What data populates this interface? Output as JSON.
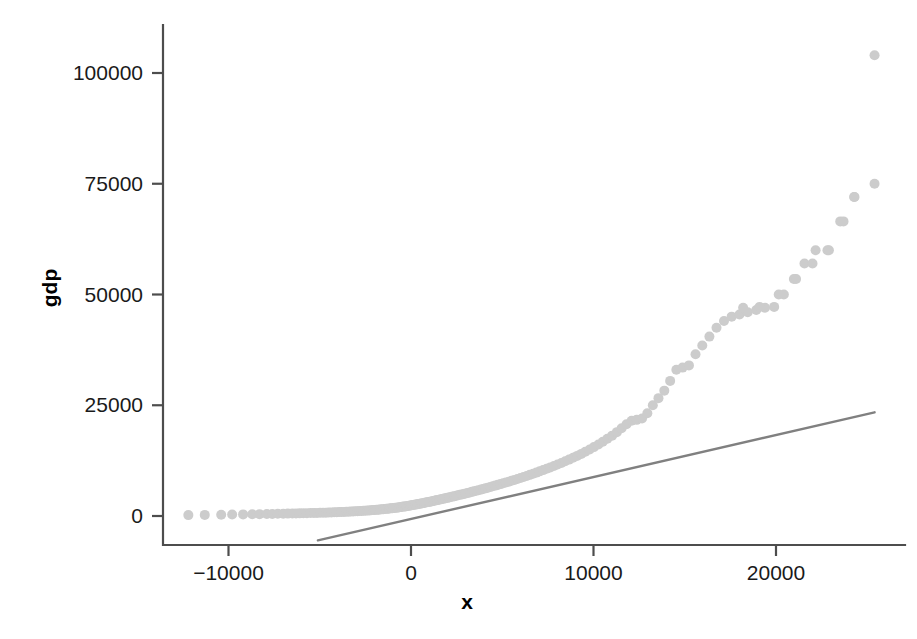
{
  "chart_data": {
    "type": "scatter",
    "title": "",
    "subtitle": "",
    "xlabel": "x",
    "ylabel": "gdp",
    "grid": false,
    "legend": null,
    "xlim": [
      -13200,
      26000
    ],
    "ylim": [
      -7000,
      108000
    ],
    "xticks": [
      -10000,
      0,
      10000,
      20000
    ],
    "xticklabels": [
      "-10000",
      "0",
      "10000",
      "20000"
    ],
    "yticks": [
      0,
      25000,
      50000,
      75000,
      100000
    ],
    "yticklabels": [
      "0",
      "25000",
      "50000",
      "75000",
      "100000"
    ],
    "point_color": "#cccccc",
    "point_size": 5,
    "line_color": "#808080",
    "series": [
      {
        "name": "gdp",
        "kind": "scatter",
        "x": [
          -12200,
          -11300,
          -10400,
          -9800,
          -9200,
          -8700,
          -8300,
          -7900,
          -7600,
          -7300,
          -7000,
          -6750,
          -6500,
          -6300,
          -6100,
          -5900,
          -5700,
          -5500,
          -5320,
          -5150,
          -4980,
          -4820,
          -4660,
          -4510,
          -4360,
          -4210,
          -4070,
          -3930,
          -3800,
          -3670,
          -3540,
          -3410,
          -3290,
          -3170,
          -3050,
          -2930,
          -2820,
          -2710,
          -2600,
          -2490,
          -2380,
          -2280,
          -2180,
          -2080,
          -1980,
          -1880,
          -1790,
          -1700,
          -1610,
          -1520,
          -1430,
          -1340,
          -1260,
          -1180,
          -1100,
          -1020,
          -940,
          -860,
          -780,
          -700,
          -630,
          -550,
          -480,
          -400,
          -330,
          -250,
          -180,
          -100,
          -30,
          40,
          110,
          190,
          260,
          340,
          410,
          490,
          560,
          640,
          720,
          800,
          880,
          960,
          1040,
          1120,
          1200,
          1290,
          1370,
          1460,
          1540,
          1630,
          1720,
          1810,
          1900,
          1990,
          2090,
          2180,
          2280,
          2380,
          2480,
          2580,
          2680,
          2790,
          2890,
          3000,
          3110,
          3230,
          3340,
          3460,
          3580,
          3700,
          3830,
          3950,
          4080,
          4210,
          4350,
          4480,
          4620,
          4760,
          4910,
          5050,
          5200,
          5360,
          5510,
          5670,
          5830,
          6000,
          6170,
          6340,
          6510,
          6690,
          6870,
          7050,
          7240,
          7430,
          7630,
          7830,
          8030,
          8240,
          8450,
          8660,
          8880,
          9100,
          9330,
          9550,
          9790,
          10020,
          10270,
          10510,
          10760,
          11020,
          11280,
          11540,
          11810,
          12090,
          12370,
          12660,
          12950,
          13250,
          13560,
          13880,
          14200,
          14540,
          14880,
          15230,
          15590,
          15960,
          16350,
          16740,
          17150,
          17570,
          18000,
          18450,
          18920,
          19400,
          19900,
          20430,
          20980,
          21560,
          22170,
          22820,
          23520,
          24280,
          25400
        ],
        "y": [
          200,
          250,
          300,
          320,
          360,
          390,
          420,
          450,
          470,
          500,
          520,
          540,
          560,
          580,
          600,
          620,
          640,
          660,
          680,
          700,
          720,
          740,
          760,
          790,
          810,
          830,
          860,
          880,
          900,
          930,
          950,
          980,
          1000,
          1030,
          1060,
          1090,
          1110,
          1140,
          1170,
          1200,
          1230,
          1260,
          1290,
          1330,
          1360,
          1390,
          1430,
          1460,
          1500,
          1530,
          1570,
          1610,
          1650,
          1690,
          1730,
          1770,
          1810,
          1850,
          1890,
          1940,
          1980,
          2030,
          2070,
          2120,
          2170,
          2220,
          2270,
          2320,
          2370,
          2430,
          2480,
          2540,
          2590,
          2650,
          2710,
          2770,
          2830,
          2900,
          2960,
          3030,
          3090,
          3160,
          3230,
          3300,
          3380,
          3450,
          3530,
          3600,
          3680,
          3760,
          3850,
          3930,
          4020,
          4100,
          4190,
          4290,
          4380,
          4480,
          4570,
          4670,
          4780,
          4880,
          4990,
          5100,
          5210,
          5330,
          5450,
          5570,
          5700,
          5830,
          5960,
          6100,
          6240,
          6390,
          6540,
          6700,
          6860,
          7030,
          7200,
          7380,
          7560,
          7750,
          7950,
          8150,
          8360,
          8580,
          8810,
          9040,
          9290,
          9540,
          9800,
          10080,
          10360,
          10660,
          10970,
          11290,
          11630,
          11980,
          12350,
          12730,
          13140,
          13570,
          14020,
          14500,
          15010,
          15550,
          16130,
          16750,
          17420,
          18140,
          18930,
          19790,
          20730,
          21500,
          21700,
          22000,
          23200,
          25000,
          26600,
          28300,
          30500,
          33000,
          33500,
          34000,
          36500,
          38500,
          40500,
          42500,
          44000,
          45000,
          45500,
          46000,
          46500,
          47000,
          47200,
          50000,
          53500,
          57000,
          60000,
          60000,
          66500,
          72000,
          75000
        ],
        "extra_points_x": [
          18200,
          19100,
          20150,
          21100,
          22000,
          22900,
          23700,
          24300,
          25400
        ],
        "extra_points_y": [
          47000,
          47200,
          50000,
          53500,
          57000,
          60000,
          66500,
          72000,
          104000
        ]
      },
      {
        "name": "fitted line",
        "kind": "line",
        "x": [
          -5100,
          25400
        ],
        "y": [
          -5500,
          23400
        ]
      }
    ]
  }
}
